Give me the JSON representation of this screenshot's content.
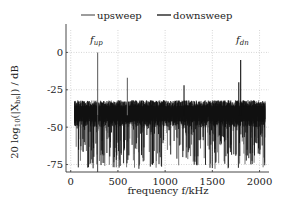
{
  "chart_data": {
    "type": "line",
    "title": "",
    "xlabel": "frequency f/kHz",
    "ylabel": "20 log10(|X_bs|) / dB",
    "ylabel_parts": {
      "prefix": "20 log",
      "sub": "10",
      "mid": "(|X",
      "sub2": "bs",
      "suffix": "|) / dB"
    },
    "xlim": [
      -50,
      2100
    ],
    "ylim": [
      -80,
      15
    ],
    "x_ticks": [
      0,
      500,
      1000,
      1500,
      2000
    ],
    "x_tick_labels": [
      "0",
      "500",
      "1000",
      "1500",
      "2000"
    ],
    "y_ticks": [
      0,
      -25,
      -50,
      -75
    ],
    "y_tick_labels": [
      "0",
      "-25",
      "-50",
      "-75"
    ],
    "grid": true,
    "legend_position": "top",
    "legend": [
      {
        "name": "upsweep",
        "color": "#666666"
      },
      {
        "name": "downsweep",
        "color": "#111111"
      }
    ],
    "annotations": [
      {
        "text": "f",
        "sub": "up",
        "x": 285,
        "y": 5
      },
      {
        "text": "f",
        "sub": "dn",
        "x": 1800,
        "y": 5
      }
    ],
    "noise_floor": {
      "x_range": [
        40,
        2060
      ],
      "upper_db": -32,
      "mean_db": -42,
      "lower_db": -70
    },
    "series": [
      {
        "name": "upsweep",
        "color": "#666666",
        "peaks": [
          {
            "x": 285,
            "y": 0
          },
          {
            "x": 600,
            "y": -17
          }
        ]
      },
      {
        "name": "downsweep",
        "color": "#111111",
        "peaks": [
          {
            "x": 1200,
            "y": -22
          },
          {
            "x": 1780,
            "y": -20
          },
          {
            "x": 1800,
            "y": -5
          }
        ]
      }
    ]
  }
}
